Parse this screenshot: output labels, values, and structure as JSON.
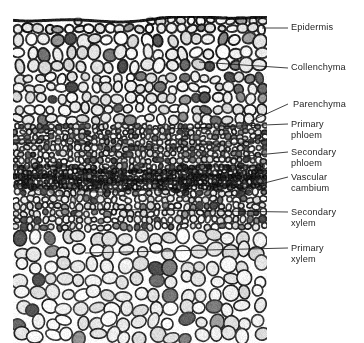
{
  "figure": {
    "kind": "labeled-light-micrograph",
    "background_color": "#ffffff",
    "text_color": "#272727",
    "leader_color": "#111111"
  },
  "micrograph": {
    "name": "stem-cross-section-micrograph",
    "alt": "Black and white light micrograph of a plant stem cross section showing rows of cells from the outer epidermis inward to the pith",
    "left": 13,
    "top": 16,
    "width": 254,
    "height": 327,
    "bands": [
      {
        "id": "epidermis",
        "y0": 0.0,
        "y1": 0.052,
        "cell": 10,
        "tone": 0.26,
        "wall": 0.92,
        "jitter": 0.3
      },
      {
        "id": "collenchyma",
        "y0": 0.052,
        "y1": 0.175,
        "cell": 13,
        "tone": 0.16,
        "wall": 0.82,
        "jitter": 0.34
      },
      {
        "id": "parenchyma",
        "y0": 0.175,
        "y1": 0.33,
        "cell": 11,
        "tone": 0.18,
        "wall": 0.74,
        "jitter": 0.4
      },
      {
        "id": "primary-phloem",
        "y0": 0.33,
        "y1": 0.395,
        "cell": 6,
        "tone": 0.3,
        "wall": 0.7,
        "jitter": 0.45
      },
      {
        "id": "secondary-phloem",
        "y0": 0.395,
        "y1": 0.47,
        "cell": 6,
        "tone": 0.34,
        "wall": 0.72,
        "jitter": 0.45
      },
      {
        "id": "vascular-cambium",
        "y0": 0.47,
        "y1": 0.53,
        "cell": 5,
        "tone": 0.48,
        "wall": 0.86,
        "jitter": 0.4
      },
      {
        "id": "secondary-xylem",
        "y0": 0.53,
        "y1": 0.655,
        "cell": 7,
        "tone": 0.24,
        "wall": 0.7,
        "jitter": 0.42
      },
      {
        "id": "primary-xylem",
        "y0": 0.655,
        "y1": 1.0,
        "cell": 15,
        "tone": 0.12,
        "wall": 0.66,
        "jitter": 0.48
      }
    ]
  },
  "annotations": [
    {
      "id": "epidermis",
      "name": "label-epidermis",
      "text": "Epidermis",
      "label_x": 291,
      "label_y": 22,
      "leader": [
        [
          262,
          28
        ],
        [
          288,
          28
        ]
      ]
    },
    {
      "id": "collenchyma",
      "name": "label-collenchyma",
      "text": "Collenchyma",
      "label_x": 291,
      "label_y": 62,
      "leader": [
        [
          199,
          62
        ],
        [
          288,
          68
        ]
      ]
    },
    {
      "id": "parenchyma",
      "name": "label-parenchyma",
      "text": "Parenchyma",
      "label_x": 293,
      "label_y": 99,
      "leader": [
        [
          251,
          121
        ],
        [
          288,
          104
        ]
      ]
    },
    {
      "id": "primary-phloem",
      "name": "label-primary-phloem",
      "text": "Primary\nphloem",
      "label_x": 291,
      "label_y": 119,
      "leader": [
        [
          168,
          129
        ],
        [
          288,
          124
        ]
      ]
    },
    {
      "id": "secondary-phloem",
      "name": "label-secondary-phloem",
      "text": "Secondary\nphloem",
      "label_x": 291,
      "label_y": 147,
      "leader": [
        [
          226,
          158
        ],
        [
          288,
          152
        ]
      ]
    },
    {
      "id": "vascular-cambium",
      "name": "label-vascular-cambium",
      "text": "Vascular\ncambium",
      "label_x": 291,
      "label_y": 172,
      "leader": [
        [
          237,
          190
        ],
        [
          288,
          177
        ]
      ]
    },
    {
      "id": "secondary-xylem",
      "name": "label-secondary-xylem",
      "text": "Secondary\nxylem",
      "label_x": 291,
      "label_y": 207,
      "leader": [
        [
          85,
          209
        ],
        [
          288,
          212
        ]
      ]
    },
    {
      "id": "primary-xylem",
      "name": "label-primary-xylem",
      "text": "Primary\nxylem",
      "label_x": 291,
      "label_y": 243,
      "leader": [
        [
          85,
          253
        ],
        [
          288,
          248
        ]
      ]
    }
  ]
}
